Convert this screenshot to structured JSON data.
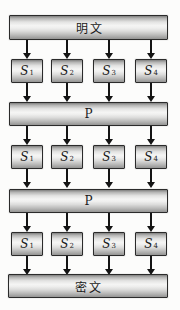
{
  "nodes": {
    "plaintext": {
      "label": "明文"
    },
    "permutation1": {
      "label": "P"
    },
    "permutation2": {
      "label": "P"
    },
    "ciphertext": {
      "label": "密文"
    }
  },
  "s_rows": [
    {
      "cells": [
        {
          "base": "S",
          "sub": "1"
        },
        {
          "base": "S",
          "sub": "2"
        },
        {
          "base": "S",
          "sub": "3"
        },
        {
          "base": "S",
          "sub": "4"
        }
      ]
    },
    {
      "cells": [
        {
          "base": "S",
          "sub": "1"
        },
        {
          "base": "S",
          "sub": "2"
        },
        {
          "base": "S",
          "sub": "3"
        },
        {
          "base": "S",
          "sub": "4"
        }
      ]
    },
    {
      "cells": [
        {
          "base": "S",
          "sub": "1"
        },
        {
          "base": "S",
          "sub": "2"
        },
        {
          "base": "S",
          "sub": "3"
        },
        {
          "base": "S",
          "sub": "4"
        }
      ]
    }
  ],
  "colors": {
    "background": "#fcfcfb",
    "box_border": "#2b2b2b",
    "box_highlight": "#f5f5f4",
    "box_shadow_gray": "#8f8f8e",
    "arrow": "#141414",
    "text": "#1a1a1a"
  }
}
